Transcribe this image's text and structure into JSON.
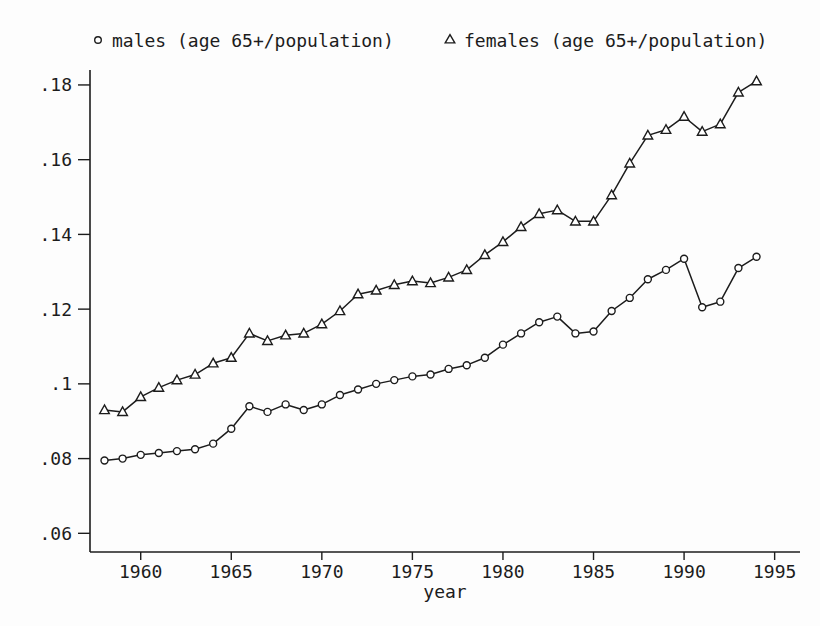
{
  "page": {
    "background": "#fdfdfd"
  },
  "colors": {
    "ink": "#1c1c1c",
    "marker_fill": "#ffffff"
  },
  "legend": {
    "items": [
      {
        "marker": "circle",
        "label": "males (age 65+/population)"
      },
      {
        "marker": "triangle",
        "label": "females (age 65+/population)"
      }
    ]
  },
  "chart_data": {
    "type": "line",
    "title": "",
    "xlabel": "year",
    "ylabel": "",
    "grid": false,
    "legend_position": "top",
    "xlim": [
      1957.2,
      1996.4
    ],
    "ylim": [
      0.055,
      0.184
    ],
    "x": [
      1958,
      1959,
      1960,
      1961,
      1962,
      1963,
      1964,
      1965,
      1966,
      1967,
      1968,
      1969,
      1970,
      1971,
      1972,
      1973,
      1974,
      1975,
      1976,
      1977,
      1978,
      1979,
      1980,
      1981,
      1982,
      1983,
      1984,
      1985,
      1986,
      1987,
      1988,
      1989,
      1990,
      1991,
      1992,
      1993,
      1994
    ],
    "series": [
      {
        "name": "males (age 65+/population)",
        "marker": "circle",
        "values": [
          0.0795,
          0.08,
          0.081,
          0.0815,
          0.082,
          0.0825,
          0.084,
          0.088,
          0.094,
          0.0925,
          0.0945,
          0.093,
          0.0945,
          0.097,
          0.0985,
          0.1,
          0.101,
          0.102,
          0.1025,
          0.104,
          0.105,
          0.107,
          0.1105,
          0.1135,
          0.1165,
          0.118,
          0.1135,
          0.114,
          0.1195,
          0.123,
          0.128,
          0.1305,
          0.1335,
          0.1205,
          0.122,
          0.131,
          0.134
        ]
      },
      {
        "name": "females (age 65+/population)",
        "marker": "triangle",
        "values": [
          0.093,
          0.0925,
          0.0965,
          0.099,
          0.101,
          0.1025,
          0.1055,
          0.107,
          0.1135,
          0.1115,
          0.113,
          0.1135,
          0.116,
          0.1195,
          0.124,
          0.125,
          0.1265,
          0.1275,
          0.127,
          0.1285,
          0.1305,
          0.1345,
          0.138,
          0.142,
          0.1455,
          0.1465,
          0.1435,
          0.1435,
          0.1505,
          0.159,
          0.1665,
          0.168,
          0.1715,
          0.1675,
          0.1695,
          0.178,
          0.181
        ]
      }
    ],
    "xticks": [
      {
        "v": 1960,
        "label": "1960"
      },
      {
        "v": 1965,
        "label": "1965"
      },
      {
        "v": 1970,
        "label": "1970"
      },
      {
        "v": 1975,
        "label": "1975"
      },
      {
        "v": 1980,
        "label": "1980"
      },
      {
        "v": 1985,
        "label": "1985"
      },
      {
        "v": 1990,
        "label": "1990"
      },
      {
        "v": 1995,
        "label": "1995"
      }
    ],
    "yticks": [
      {
        "v": 0.06,
        "label": ".06"
      },
      {
        "v": 0.08,
        "label": ".08"
      },
      {
        "v": 0.1,
        "label": ".1"
      },
      {
        "v": 0.12,
        "label": ".12"
      },
      {
        "v": 0.14,
        "label": ".14"
      },
      {
        "v": 0.16,
        "label": ".16"
      },
      {
        "v": 0.18,
        "label": ".18"
      }
    ]
  }
}
